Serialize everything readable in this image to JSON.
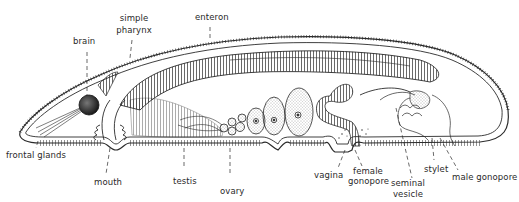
{
  "diagram": {
    "labels": {
      "brain": "brain",
      "simple_pharynx_1": "simple",
      "simple_pharynx_2": "pharynx",
      "enteron": "enteron",
      "frontal_glands": "frontal glands",
      "mouth": "mouth",
      "testis": "testis",
      "ovary": "ovary",
      "vagina": "vagina",
      "female_gonopore_1": "female",
      "female_gonopore_2": "gonopore",
      "seminal_vesicle_1": "seminal",
      "seminal_vesicle_2": "vesicle",
      "stylet": "stylet",
      "male_gonopore": "male gonopore"
    },
    "colors": {
      "ink": "#2a2a2a",
      "background": "#ffffff",
      "stipple": "#555555"
    }
  }
}
